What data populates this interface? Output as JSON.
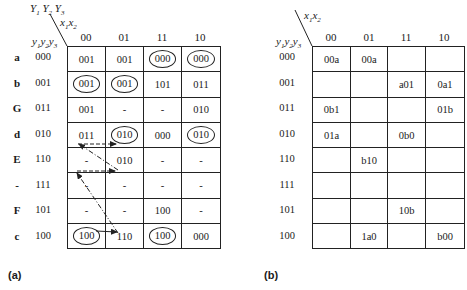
{
  "figure_a": {
    "caption": "(a)",
    "corner": {
      "next_state_label": "Y1Y2Y3",
      "input_label": "x1x2",
      "state_label": "y1y2y3"
    },
    "columns": [
      "00",
      "01",
      "11",
      "10"
    ],
    "rows": [
      {
        "name": "a",
        "code": "000",
        "cells": [
          {
            "v": "001",
            "c": false
          },
          {
            "v": "001",
            "c": false
          },
          {
            "v": "000",
            "c": true
          },
          {
            "v": "000",
            "c": true
          }
        ]
      },
      {
        "name": "b",
        "code": "001",
        "cells": [
          {
            "v": "001",
            "c": true
          },
          {
            "v": "001",
            "c": true
          },
          {
            "v": "101",
            "c": false
          },
          {
            "v": "011",
            "c": false
          }
        ]
      },
      {
        "name": "G",
        "code": "011",
        "cells": [
          {
            "v": "001",
            "c": false
          },
          {
            "v": "-",
            "c": false
          },
          {
            "v": "-",
            "c": false
          },
          {
            "v": "010",
            "c": false
          }
        ]
      },
      {
        "name": "d",
        "code": "010",
        "cells": [
          {
            "v": "011",
            "c": false
          },
          {
            "v": "010",
            "c": true
          },
          {
            "v": "000",
            "c": false
          },
          {
            "v": "010",
            "c": true
          }
        ]
      },
      {
        "name": "E",
        "code": "110",
        "cells": [
          {
            "v": "-",
            "c": false
          },
          {
            "v": "010",
            "c": false
          },
          {
            "v": "-",
            "c": false
          },
          {
            "v": "-",
            "c": false
          }
        ]
      },
      {
        "name": "-",
        "code": "111",
        "cells": [
          {
            "v": "-",
            "c": false
          },
          {
            "v": "-",
            "c": false
          },
          {
            "v": "-",
            "c": false
          },
          {
            "v": "-",
            "c": false
          }
        ]
      },
      {
        "name": "F",
        "code": "101",
        "cells": [
          {
            "v": "-",
            "c": false
          },
          {
            "v": "-",
            "c": false
          },
          {
            "v": "100",
            "c": false
          },
          {
            "v": "-",
            "c": false
          }
        ]
      },
      {
        "name": "c",
        "code": "100",
        "cells": [
          {
            "v": "100",
            "c": true
          },
          {
            "v": "110",
            "c": false
          },
          {
            "v": "100",
            "c": true
          },
          {
            "v": "000",
            "c": false
          }
        ]
      }
    ],
    "arrows": [
      {
        "style": "dashed",
        "from": "d,00",
        "to": "d,01"
      },
      {
        "style": "dash-dot",
        "from": "E,01",
        "to": "d,00"
      },
      {
        "style": "dashed",
        "from": "E,00",
        "to": "E,01"
      },
      {
        "style": "dash-dot",
        "from": "c,01",
        "to": "E,00"
      },
      {
        "style": "solid",
        "from": "c,00",
        "to": "c,01"
      }
    ]
  },
  "figure_b": {
    "caption": "(b)",
    "corner": {
      "input_label": "x1x2",
      "state_label": "y1y2y3"
    },
    "columns": [
      "00",
      "01",
      "11",
      "10"
    ],
    "rows": [
      {
        "code": "000",
        "cells": [
          "00a",
          "00a",
          "",
          ""
        ]
      },
      {
        "code": "001",
        "cells": [
          "",
          "",
          "a01",
          "0a1"
        ]
      },
      {
        "code": "011",
        "cells": [
          "0b1",
          "",
          "",
          "01b"
        ]
      },
      {
        "code": "010",
        "cells": [
          "01a",
          "",
          "0b0",
          ""
        ]
      },
      {
        "code": "110",
        "cells": [
          "",
          "b10",
          "",
          ""
        ]
      },
      {
        "code": "111",
        "cells": [
          "",
          "",
          "",
          ""
        ]
      },
      {
        "code": "101",
        "cells": [
          "",
          "",
          "10b",
          ""
        ]
      },
      {
        "code": "100",
        "cells": [
          "",
          "1a0",
          "",
          "b00"
        ]
      }
    ]
  }
}
